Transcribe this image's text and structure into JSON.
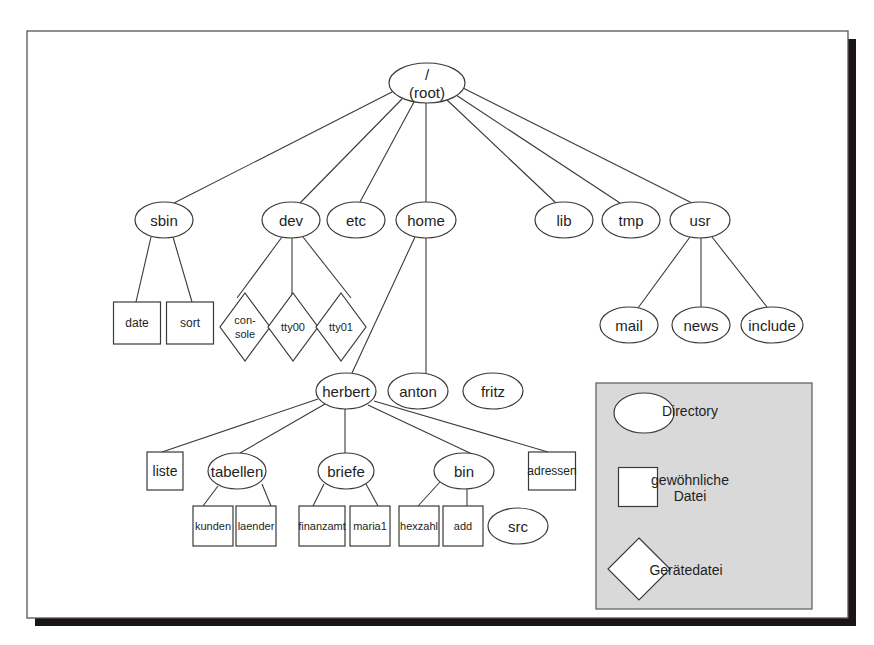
{
  "diagram": {
    "frame": {
      "x": 27,
      "y": 31,
      "w": 821,
      "h": 587,
      "shadow": 8,
      "border": "#555555",
      "shadow_color": "#1a1514"
    },
    "colors": {
      "stroke": "#3a3a3a",
      "fill": "#ffffff",
      "legend_bg": "#d9d9d9",
      "text": "#1e1e1e"
    },
    "nodes": [
      {
        "id": "root",
        "label": "/",
        "label2": "(root)",
        "type": "directory",
        "x": 427,
        "y": 83,
        "rx": 38,
        "ry": 20,
        "fs": 15
      },
      {
        "id": "sbin",
        "label": "sbin",
        "type": "directory",
        "x": 164,
        "y": 220,
        "rx": 29,
        "ry": 18,
        "fs": 15
      },
      {
        "id": "dev",
        "label": "dev",
        "type": "directory",
        "x": 291,
        "y": 220,
        "rx": 29,
        "ry": 18,
        "fs": 15
      },
      {
        "id": "etc",
        "label": "etc",
        "type": "directory",
        "x": 356,
        "y": 220,
        "rx": 29,
        "ry": 18,
        "fs": 15
      },
      {
        "id": "home",
        "label": "home",
        "type": "directory",
        "x": 426,
        "y": 220,
        "rx": 30,
        "ry": 18,
        "fs": 15
      },
      {
        "id": "lib",
        "label": "lib",
        "type": "directory",
        "x": 564,
        "y": 220,
        "rx": 29,
        "ry": 18,
        "fs": 15
      },
      {
        "id": "tmp",
        "label": "tmp",
        "type": "directory",
        "x": 631,
        "y": 220,
        "rx": 29,
        "ry": 18,
        "fs": 15
      },
      {
        "id": "usr",
        "label": "usr",
        "type": "directory",
        "x": 700,
        "y": 220,
        "rx": 30,
        "ry": 18,
        "fs": 15
      },
      {
        "id": "date",
        "label": "date",
        "type": "file",
        "x": 137,
        "y": 323,
        "w": 47,
        "h": 42,
        "fs": 12
      },
      {
        "id": "sort",
        "label": "sort",
        "type": "file",
        "x": 190,
        "y": 323,
        "w": 47,
        "h": 42,
        "fs": 12
      },
      {
        "id": "console",
        "label": "con-",
        "label2": "sole",
        "type": "device",
        "x": 245,
        "y": 327,
        "r": 25,
        "fs": 11
      },
      {
        "id": "tty00",
        "label": "tty00",
        "type": "device",
        "x": 293,
        "y": 327,
        "r": 25,
        "fs": 11
      },
      {
        "id": "tty01",
        "label": "tty01",
        "type": "device",
        "x": 341,
        "y": 327,
        "r": 25,
        "fs": 11
      },
      {
        "id": "mail",
        "label": "mail",
        "type": "directory",
        "x": 629,
        "y": 325,
        "rx": 29,
        "ry": 18,
        "fs": 15
      },
      {
        "id": "news",
        "label": "news",
        "type": "directory",
        "x": 701,
        "y": 325,
        "rx": 29,
        "ry": 18,
        "fs": 15
      },
      {
        "id": "include",
        "label": "include",
        "type": "directory",
        "x": 772,
        "y": 325,
        "rx": 31,
        "ry": 18,
        "fs": 15
      },
      {
        "id": "herbert",
        "label": "herbert",
        "type": "directory",
        "x": 346,
        "y": 391,
        "rx": 30,
        "ry": 18,
        "fs": 15
      },
      {
        "id": "anton",
        "label": "anton",
        "type": "directory",
        "x": 418,
        "y": 391,
        "rx": 30,
        "ry": 18,
        "fs": 15
      },
      {
        "id": "fritz",
        "label": "fritz",
        "type": "directory",
        "x": 493,
        "y": 391,
        "rx": 30,
        "ry": 18,
        "fs": 15
      },
      {
        "id": "liste",
        "label": "liste",
        "type": "file",
        "x": 165,
        "y": 471,
        "w": 36,
        "h": 38,
        "fs": 14
      },
      {
        "id": "tabellen",
        "label": "tabellen",
        "type": "directory",
        "x": 237,
        "y": 471,
        "rx": 29,
        "ry": 18,
        "fs": 15
      },
      {
        "id": "briefe",
        "label": "briefe",
        "type": "directory",
        "x": 346,
        "y": 471,
        "rx": 28,
        "ry": 18,
        "fs": 15
      },
      {
        "id": "bin",
        "label": "bin",
        "type": "directory",
        "x": 464,
        "y": 471,
        "rx": 30,
        "ry": 18,
        "fs": 15
      },
      {
        "id": "adressen",
        "label": "adressen",
        "type": "file",
        "x": 552,
        "y": 471,
        "w": 47,
        "h": 38,
        "fs": 12
      },
      {
        "id": "kunden",
        "label": "kunden",
        "type": "file",
        "x": 213,
        "y": 526,
        "w": 40,
        "h": 40,
        "fs": 11
      },
      {
        "id": "laender",
        "label": "laender",
        "type": "file",
        "x": 256,
        "y": 526,
        "w": 40,
        "h": 40,
        "fs": 11
      },
      {
        "id": "finanzamt",
        "label": "finanzamt",
        "type": "file",
        "x": 322,
        "y": 526,
        "w": 46,
        "h": 40,
        "fs": 11
      },
      {
        "id": "maria1",
        "label": "maria1",
        "type": "file",
        "x": 370,
        "y": 526,
        "w": 40,
        "h": 40,
        "fs": 11
      },
      {
        "id": "hexzahl",
        "label": "hexzahl",
        "type": "file",
        "x": 419,
        "y": 526,
        "w": 40,
        "h": 40,
        "fs": 11
      },
      {
        "id": "add",
        "label": "add",
        "type": "file",
        "x": 463,
        "y": 526,
        "w": 40,
        "h": 40,
        "fs": 11
      },
      {
        "id": "src",
        "label": "src",
        "type": "directory",
        "x": 518,
        "y": 526,
        "rx": 30,
        "ry": 18,
        "fs": 15
      }
    ],
    "edges": [
      {
        "from": "root",
        "to": "sbin",
        "x1": 392,
        "y1": 92,
        "x2": 174,
        "y2": 203
      },
      {
        "from": "root",
        "to": "dev",
        "x1": 402,
        "y1": 99,
        "x2": 300,
        "y2": 203
      },
      {
        "from": "root",
        "to": "etc",
        "x1": 414,
        "y1": 102,
        "x2": 360,
        "y2": 202
      },
      {
        "from": "root",
        "to": "home",
        "x1": 426,
        "y1": 103,
        "x2": 426,
        "y2": 202
      },
      {
        "from": "root",
        "to": "lib",
        "x1": 446,
        "y1": 99,
        "x2": 556,
        "y2": 203
      },
      {
        "from": "root",
        "to": "tmp",
        "x1": 456,
        "y1": 95,
        "x2": 620,
        "y2": 203
      },
      {
        "from": "root",
        "to": "usr",
        "x1": 463,
        "y1": 88,
        "x2": 692,
        "y2": 203
      },
      {
        "from": "sbin",
        "to": "date",
        "x1": 151,
        "y1": 237,
        "x2": 136,
        "y2": 302
      },
      {
        "from": "sbin",
        "to": "sort",
        "x1": 173,
        "y1": 237,
        "x2": 192,
        "y2": 302
      },
      {
        "from": "dev",
        "to": "console",
        "x1": 282,
        "y1": 237,
        "x2": 237,
        "y2": 298
      },
      {
        "from": "dev",
        "to": "tty00",
        "x1": 292,
        "y1": 238,
        "x2": 292,
        "y2": 297
      },
      {
        "from": "dev",
        "to": "tty01",
        "x1": 303,
        "y1": 237,
        "x2": 351,
        "y2": 298
      },
      {
        "from": "home",
        "to": "herbert",
        "x1": 415,
        "y1": 237,
        "x2": 352,
        "y2": 373
      },
      {
        "from": "home",
        "to": "anton",
        "x1": 426,
        "y1": 238,
        "x2": 426,
        "y2": 373
      },
      {
        "from": "usr",
        "to": "mail",
        "x1": 690,
        "y1": 237,
        "x2": 638,
        "y2": 308
      },
      {
        "from": "usr",
        "to": "news",
        "x1": 701,
        "y1": 238,
        "x2": 701,
        "y2": 307
      },
      {
        "from": "usr",
        "to": "include",
        "x1": 712,
        "y1": 237,
        "x2": 767,
        "y2": 307
      },
      {
        "from": "herbert",
        "to": "liste",
        "x1": 318,
        "y1": 399,
        "x2": 162,
        "y2": 452
      },
      {
        "from": "herbert",
        "to": "tabellen",
        "x1": 325,
        "y1": 404,
        "x2": 240,
        "y2": 453
      },
      {
        "from": "herbert",
        "to": "briefe",
        "x1": 345,
        "y1": 409,
        "x2": 345,
        "y2": 453
      },
      {
        "from": "herbert",
        "to": "bin",
        "x1": 368,
        "y1": 405,
        "x2": 472,
        "y2": 454
      },
      {
        "from": "herbert",
        "to": "adressen",
        "x1": 374,
        "y1": 401,
        "x2": 548,
        "y2": 452
      },
      {
        "from": "tabellen",
        "to": "kunden",
        "x1": 218,
        "y1": 486,
        "x2": 203,
        "y2": 506
      },
      {
        "from": "tabellen",
        "to": "laender",
        "x1": 262,
        "y1": 484,
        "x2": 271,
        "y2": 506
      },
      {
        "from": "briefe",
        "to": "finanzamt",
        "x1": 324,
        "y1": 484,
        "x2": 313,
        "y2": 506
      },
      {
        "from": "briefe",
        "to": "maria1",
        "x1": 366,
        "y1": 484,
        "x2": 378,
        "y2": 506
      },
      {
        "from": "bin",
        "to": "hexzahl",
        "x1": 440,
        "y1": 482,
        "x2": 418,
        "y2": 506
      },
      {
        "from": "bin",
        "to": "add",
        "x1": 467,
        "y1": 489,
        "x2": 467,
        "y2": 506
      }
    ],
    "legend": {
      "x": 596,
      "y": 383,
      "w": 216,
      "h": 226,
      "items": [
        {
          "type": "directory",
          "label": "Directory",
          "sx": 644,
          "sy": 413,
          "rx": 30,
          "ry": 20,
          "tx": 690,
          "ty": 411
        },
        {
          "type": "file",
          "label": "gewöhnliche",
          "label2": "Datei",
          "sx": 638,
          "sy": 487,
          "w": 39,
          "h": 39,
          "tx": 690,
          "ty": 480
        },
        {
          "type": "device",
          "label": "Gerätedatei",
          "sx": 639,
          "sy": 569,
          "r": 31,
          "tx": 686,
          "ty": 570
        }
      ]
    }
  }
}
